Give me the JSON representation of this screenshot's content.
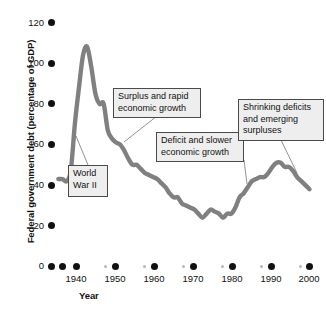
{
  "chart_data": {
    "type": "line",
    "title": "",
    "xlabel": "Year",
    "ylabel": "Federal government debt (percentage of GDP)",
    "xlim": [
      1938,
      2001
    ],
    "ylim": [
      0,
      120
    ],
    "grid": false,
    "legend": "none",
    "series": [
      {
        "name": "Federal government debt",
        "color": "#808080",
        "x": [
          1939,
          1940,
          1941,
          1942,
          1943,
          1944,
          1945,
          1946,
          1947,
          1948,
          1949,
          1950,
          1951,
          1952,
          1953,
          1954,
          1955,
          1956,
          1957,
          1958,
          1959,
          1960,
          1961,
          1962,
          1963,
          1964,
          1965,
          1966,
          1967,
          1968,
          1969,
          1970,
          1971,
          1972,
          1973,
          1974,
          1975,
          1976,
          1977,
          1978,
          1979,
          1980,
          1981,
          1982,
          1983,
          1984,
          1985,
          1986,
          1987,
          1988,
          1989,
          1990,
          1991,
          1992,
          1993,
          1994,
          1995,
          1996,
          1997,
          1998,
          1999,
          2000
        ],
        "values": [
          43,
          43,
          42,
          47,
          70,
          88,
          104,
          108,
          98,
          85,
          80,
          80,
          67,
          63,
          61,
          60,
          57,
          53,
          50,
          50,
          48,
          46,
          45,
          44,
          43,
          41,
          39,
          36,
          34,
          34,
          31,
          30,
          29,
          28,
          26,
          24,
          26,
          28,
          27,
          26,
          24,
          26,
          26,
          29,
          34,
          36,
          39,
          42,
          43,
          44,
          44,
          46,
          49,
          51,
          51,
          49,
          49,
          47,
          44,
          42,
          40,
          38
        ],
        "annotated_points": {
          "start_1939": 43,
          "wwii_peak_1946": 108,
          "low_1974": 24,
          "low_1980": 26,
          "high_1993": 51,
          "end_2000": 38
        }
      }
    ],
    "yticks": [
      0,
      20,
      40,
      60,
      80,
      100,
      120
    ],
    "xticks": [
      1940,
      1950,
      1960,
      1970,
      1980,
      1990,
      2000
    ],
    "xminor_ticks": [
      1945,
      1955,
      1965,
      1975,
      1985,
      1995
    ],
    "extra_axis_dots": [
      1935,
      1940
    ],
    "annotations": [
      {
        "id": "world-war-ii",
        "text": "World\nWar II",
        "box": {
          "left": 68,
          "top": 165,
          "width": 40,
          "height": 32
        },
        "leader_to": {
          "x": 76,
          "y": 136
        }
      },
      {
        "id": "surplus-and-rapid-economic-growth",
        "text": "Surplus and rapid\neconomic growth",
        "box": {
          "left": 113,
          "top": 88,
          "width": 88,
          "height": 28
        },
        "leader_to": {
          "x": 124,
          "y": 142
        }
      },
      {
        "id": "deficit-and-slower-economic-growth",
        "text": "Deficit and slower\neconomic growth",
        "box": {
          "left": 156,
          "top": 132,
          "width": 88,
          "height": 28
        },
        "leader_to": {
          "x": 247,
          "y": 184
        }
      },
      {
        "id": "shrinking-deficits-and-emerging-surpluses",
        "text": "Shrinking deficits\nand emerging\nsurpluses",
        "box": {
          "left": 238,
          "top": 99,
          "width": 86,
          "height": 41
        },
        "leader_to": {
          "x": 297,
          "y": 173
        }
      }
    ]
  },
  "axes": {
    "y_title": "Federal government debt (percentage of GDP)",
    "x_title": "Year",
    "y_tick_labels": [
      "120",
      "100",
      "80",
      "60",
      "40",
      "20",
      "0"
    ],
    "x_tick_labels": [
      "1940",
      "1950",
      "1960",
      "1970",
      "1980",
      "1990",
      "2000"
    ]
  },
  "colors": {
    "line": "#808080",
    "callout_fill": "#eeeeee",
    "callout_border": "#4a4a4a",
    "text": "#111111",
    "minor_tick": "#b8b8b8",
    "background": "#ffffff"
  }
}
